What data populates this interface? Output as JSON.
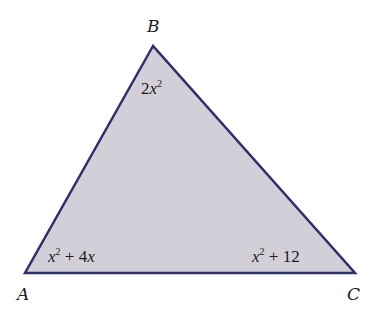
{
  "diagram": {
    "type": "triangle",
    "fill_color": "#d3cfd9",
    "stroke_color": "#2e2f6b",
    "vertices": [
      {
        "name": "A",
        "label": "A"
      },
      {
        "name": "B",
        "label": "B"
      },
      {
        "name": "C",
        "label": "C"
      }
    ],
    "angles": {
      "A": {
        "coef": "",
        "var": "x",
        "exp": "2",
        "rest": " + 4",
        "rest_var": "x"
      },
      "B": {
        "coef": "2",
        "var": "x",
        "exp": "2"
      },
      "C": {
        "var": "x",
        "exp": "2",
        "rest": " + 12"
      }
    }
  }
}
